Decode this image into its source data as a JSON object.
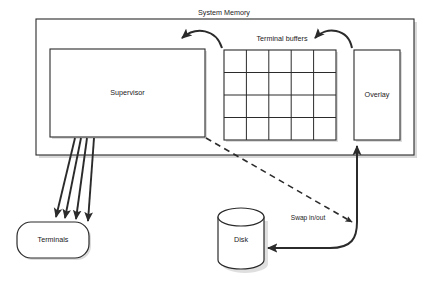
{
  "diagram": {
    "title": "System Memory",
    "nodes": {
      "system_memory": {
        "label": "System Memory"
      },
      "supervisor": {
        "label": "Supervisor"
      },
      "terminal_buffers": {
        "label": "Terminal buffers",
        "columns": 5,
        "rows": 4
      },
      "overlay": {
        "label": "Overlay"
      },
      "terminals": {
        "label": "Terminals"
      },
      "disk": {
        "label": "Disk"
      }
    },
    "edges": {
      "swap": {
        "label": "Swap in/out"
      },
      "terminal_lines": {
        "count": 4
      }
    },
    "colors": {
      "stroke": "#2b2b2b",
      "fill": "#ffffff",
      "text": "#1a1a1a",
      "shadow": "#b9b9b9",
      "background": "#ffffff"
    }
  }
}
